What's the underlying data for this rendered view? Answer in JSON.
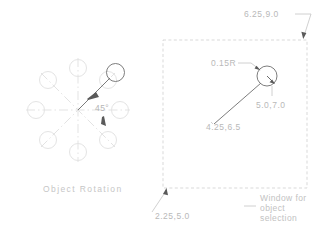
{
  "figure": {
    "title_left": "Object Rotation",
    "note_right": [
      "Window for",
      "object",
      "selection"
    ],
    "angle_label": "45°",
    "radius_label": "0.15R",
    "coords": {
      "top_right": "6.25,9.0",
      "circle_center": "5.0,7.0",
      "line_start": "4.25,6.5",
      "bottom_left": "2.25,5.0"
    }
  },
  "colors": {
    "background": "#ffffff",
    "ghost_geometry": "#e2e2e2",
    "centerline": "#d8d8d8",
    "solid_geometry": "#6e6e6e",
    "dashed_window": "#d5d5d5",
    "leader": "#bdbdbd",
    "text_dim": "#b9b9b9",
    "text_caption": "#c6c6c6"
  },
  "left_figure": {
    "type": "polar-array",
    "center": {
      "x": 78,
      "y": 110
    },
    "array_radius": 42,
    "circle_radius": 8.5,
    "count": 8,
    "angles_deg": [
      0,
      45,
      90,
      135,
      180,
      225,
      270,
      315
    ],
    "highlighted_angle_deg": 45,
    "rotation_deg": 45
  },
  "right_figure": {
    "type": "selection-window",
    "window": {
      "x": 163,
      "y": 40,
      "width": 144,
      "height": 148
    },
    "circle": {
      "cx": 267,
      "cy": 76,
      "r": 10
    },
    "radius_value": 0.15,
    "object_line": {
      "x1": 214,
      "y1": 124,
      "x2": 262,
      "y2": 82
    }
  }
}
